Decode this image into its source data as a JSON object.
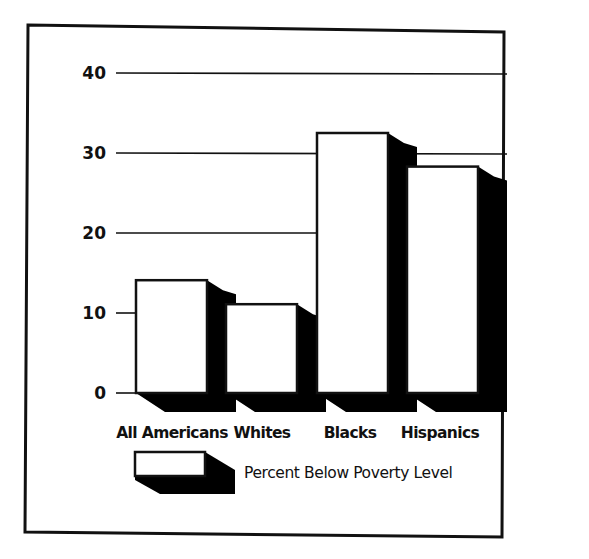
{
  "chart_data": {
    "type": "bar",
    "style": "3d-shadow",
    "title": "",
    "xlabel": "",
    "ylabel": "",
    "categories": [
      "All Americans",
      "Whites",
      "Blacks",
      "Hispanics"
    ],
    "series": [
      {
        "name": "Percent Below Poverty Level",
        "values": [
          14.1,
          11.1,
          32.5,
          28.3
        ]
      }
    ],
    "yticks": [
      0,
      10,
      20,
      30,
      40
    ],
    "ylim": [
      0,
      40
    ],
    "grid": true,
    "legend_position": "bottom"
  },
  "colors": {
    "bar_face": "#ffffff",
    "bar_shadow": "#000000",
    "axis": "#111111",
    "frame": "#111111"
  }
}
